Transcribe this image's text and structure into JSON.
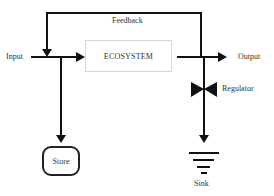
{
  "diagram": {
    "type": "flow",
    "nodes": {
      "ecosystem": {
        "label": "ECOSYSTEM"
      },
      "store": {
        "label": "Store"
      },
      "sink": {
        "label": "Sink"
      }
    },
    "labels": {
      "input": "Input",
      "output": "Output",
      "feedback": "Feedback",
      "regulator": "Regulator"
    },
    "edges": [
      {
        "from": "input",
        "to": "ecosystem"
      },
      {
        "from": "input",
        "to": "store"
      },
      {
        "from": "ecosystem",
        "to": "output"
      },
      {
        "from": "output",
        "to": "input",
        "label": "Feedback"
      },
      {
        "from": "output",
        "to": "sink",
        "via": "regulator"
      }
    ],
    "colors": {
      "line": "#111111",
      "box_border": "#d8d8d8",
      "background": "#ffffff"
    }
  }
}
